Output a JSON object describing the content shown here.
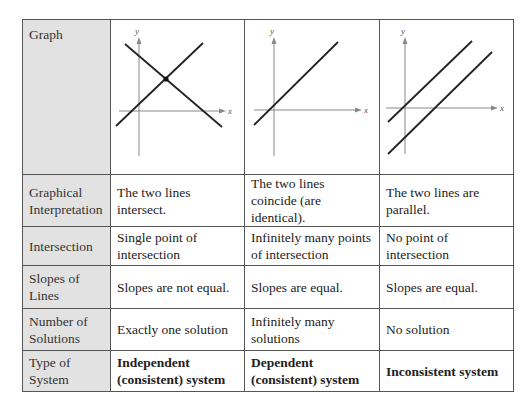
{
  "table": {
    "rows": [
      {
        "header": "Graph",
        "cells": [
          "",
          "",
          ""
        ]
      },
      {
        "header": "Graphical Interpretation",
        "cells": [
          "The two lines intersect.",
          "The two lines coincide (are identical).",
          "The two lines are parallel."
        ]
      },
      {
        "header": "Intersection",
        "cells": [
          "Single point of intersection",
          "Infinitely many points of intersection",
          "No point of intersection"
        ]
      },
      {
        "header": "Slopes of Lines",
        "cells": [
          "Slopes are not equal.",
          "Slopes are equal.",
          "Slopes are equal."
        ]
      },
      {
        "header": "Number of Solutions",
        "cells": [
          "Exactly one solution",
          "Infinitely many solutions",
          "No solution"
        ]
      },
      {
        "header": "Type of System",
        "cells": [
          "Independent (consistent) system",
          "Dependent (consistent) system",
          "Inconsistent system"
        ]
      }
    ]
  },
  "graphs": {
    "x_label": "x",
    "y_label": "y",
    "graph1": "two-intersecting-lines",
    "graph2": "coincident-line",
    "graph3": "two-parallel-lines"
  },
  "colors": {
    "header_bg": "#e2e2e2",
    "border": "#555555",
    "line": "#222222",
    "axis": "#888888"
  }
}
